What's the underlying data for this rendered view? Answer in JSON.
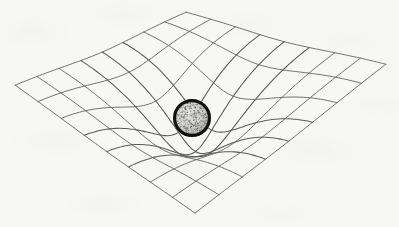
{
  "figure": {
    "description": "A two-dimensional rectangular grid rendered in oblique perspective as a diamond-shaped sheet, deformed downward into a funnel-shaped gravity well by a heavy speckled sphere resting at its center.",
    "canvas": {
      "width": 399,
      "height": 227
    },
    "background_color": "#f7f7f5"
  },
  "chart_data": {
    "type": "surface-mesh",
    "xlabel": "",
    "ylabel": "",
    "grid": true,
    "legend_position": "none",
    "projection": {
      "kind": "oblique-diamond",
      "corner_left": {
        "x": 15,
        "y": 85
      },
      "corner_top": {
        "x": 186,
        "y": 12
      },
      "corner_right": {
        "x": 386,
        "y": 64
      },
      "corner_bottom": {
        "x": 195,
        "y": 213
      }
    },
    "mesh": {
      "divisions_u": 8,
      "divisions_v": 8,
      "line_color": "#5a5a58",
      "line_width": 0.85,
      "line_width_deep": 1.05
    },
    "well": {
      "center_u": 0.5,
      "center_v": 0.5,
      "depth_px": 58,
      "radius_u": 0.34,
      "falloff": "gaussian",
      "pinch": 0.62,
      "annotation": "Gravity well produced by the central mass"
    },
    "sphere": {
      "center_x": 192,
      "center_y": 118,
      "radius": 19,
      "rim_color": "#111110",
      "rim_width": 3.2,
      "fill_color": "#d2d2ce",
      "speckle_color": "#4a4a47",
      "speckle_count": 430,
      "label": "massive body"
    }
  }
}
